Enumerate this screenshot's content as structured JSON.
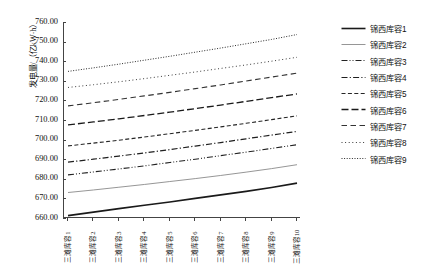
{
  "chart_data": {
    "type": "line",
    "title": "",
    "xlabel": "",
    "ylabel": "发电量/（亿kW·h）",
    "ylim": [
      660,
      760
    ],
    "yticks": [
      660,
      670,
      680,
      690,
      700,
      710,
      720,
      730,
      740,
      750,
      760
    ],
    "ytick_labels": [
      "660.00",
      "670.00",
      "680.00",
      "690.00",
      "700.00",
      "710.00",
      "720.00",
      "730.00",
      "740.00",
      "750.00",
      "760.00"
    ],
    "grid": false,
    "legend_position": "right",
    "categories": [
      "三滩库容1",
      "三滩库容2",
      "三滩库容3",
      "三滩库容4",
      "三滩库容5",
      "三滩库容6",
      "三滩库容7",
      "三滩库容8",
      "三滩库容9",
      "三滩库容10"
    ],
    "series": [
      {
        "name": "锦西库容1",
        "style": "solid",
        "width": 1.6,
        "color": "#1a1a1a",
        "values": [
          661.2,
          663.0,
          664.8,
          666.5,
          668.2,
          670.0,
          671.8,
          673.6,
          675.6,
          677.8
        ]
      },
      {
        "name": "锦西库容2",
        "style": "solid",
        "width": 0.9,
        "color": "#8a8a8a",
        "values": [
          673.0,
          674.3,
          675.7,
          677.1,
          678.6,
          680.1,
          681.7,
          683.4,
          685.2,
          687.2
        ]
      },
      {
        "name": "锦西库容3",
        "style": "dashdotdot",
        "width": 1.1,
        "color": "#222222",
        "values": [
          682.0,
          683.5,
          685.0,
          686.6,
          688.3,
          690.0,
          691.8,
          693.6,
          695.5,
          697.4
        ]
      },
      {
        "name": "锦西库容4",
        "style": "dashdot",
        "width": 1.2,
        "color": "#1f1f1f",
        "values": [
          688.5,
          690.0,
          691.6,
          693.2,
          694.9,
          696.7,
          698.5,
          700.4,
          702.3,
          704.2
        ]
      },
      {
        "name": "锦西库容5",
        "style": "dashed",
        "width": 1.1,
        "color": "#262626",
        "values": [
          696.8,
          698.2,
          699.7,
          701.3,
          703.0,
          704.7,
          706.5,
          708.3,
          710.2,
          712.1
        ]
      },
      {
        "name": "锦西库容6",
        "style": "longdash",
        "width": 1.3,
        "color": "#1a1a1a",
        "values": [
          707.5,
          709.0,
          710.6,
          712.3,
          714.0,
          715.8,
          717.6,
          719.5,
          721.4,
          723.3
        ]
      },
      {
        "name": "锦西库容7",
        "style": "dash-gap",
        "width": 1.1,
        "color": "#333333",
        "values": [
          717.2,
          718.8,
          720.5,
          722.3,
          724.1,
          726.0,
          727.9,
          729.9,
          731.9,
          733.9
        ]
      },
      {
        "name": "锦西库容8",
        "style": "dotted-sparse",
        "width": 1.0,
        "color": "#3a3a3a",
        "values": [
          726.6,
          728.0,
          729.5,
          731.1,
          732.8,
          734.5,
          736.3,
          738.1,
          740.0,
          742.0
        ]
      },
      {
        "name": "锦西库容9",
        "style": "dotted",
        "width": 1.0,
        "color": "#2b2b2b",
        "values": [
          734.8,
          736.6,
          738.5,
          740.5,
          742.5,
          744.6,
          746.7,
          748.9,
          751.1,
          753.6
        ]
      }
    ]
  }
}
